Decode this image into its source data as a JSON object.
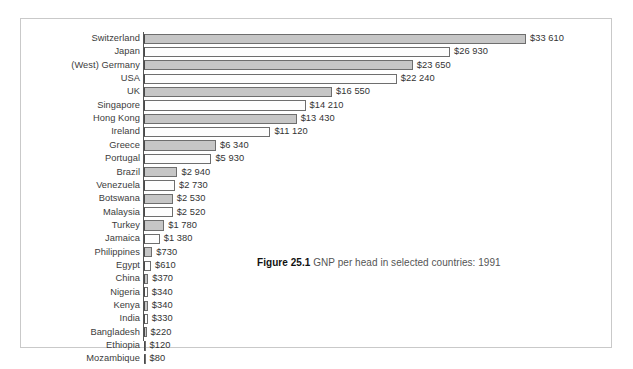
{
  "figure": {
    "number_label": "Figure 25.1",
    "caption_text": "GNP per head in selected countries: 1991"
  },
  "style": {
    "bar_fill_gray": "#c6c6c6",
    "bar_fill_white": "#fdfdfd",
    "bar_border": "#6e6e6e",
    "frame_border": "#c9c9c9",
    "label_color": "#3c3c3c"
  },
  "chart_data": {
    "type": "bar",
    "orientation": "horizontal",
    "title": "GNP per head in selected countries: 1991",
    "xlabel": "",
    "ylabel": "",
    "xlim": [
      0,
      33610
    ],
    "grid": false,
    "legend": false,
    "value_prefix": "$",
    "thousands_separator": " ",
    "categories": [
      "Switzerland",
      "Japan",
      "(West) Germany",
      "USA",
      "UK",
      "Singapore",
      "Hong Kong",
      "Ireland",
      "Greece",
      "Portugal",
      "Brazil",
      "Venezuela",
      "Botswana",
      "Malaysia",
      "Turkey",
      "Jamaica",
      "Philippines",
      "Egypt",
      "China",
      "Nigeria",
      "Kenya",
      "India",
      "Bangladesh",
      "Ethiopia",
      "Mozambique"
    ],
    "values": [
      33610,
      26930,
      23650,
      22240,
      16550,
      14210,
      13430,
      11120,
      6340,
      5930,
      2940,
      2730,
      2530,
      2520,
      1780,
      1380,
      730,
      610,
      370,
      340,
      340,
      330,
      220,
      120,
      80
    ],
    "value_labels": [
      "$33 610",
      "$26 930",
      "$23 650",
      "$22 240",
      "$16 550",
      "$14 210",
      "$13 430",
      "$11 120",
      "$6 340",
      "$5 930",
      "$2 940",
      "$2 730",
      "$2 530",
      "$2 520",
      "$1 780",
      "$1 380",
      "$730",
      "$610",
      "$370",
      "$340",
      "$340",
      "$330",
      "$220",
      "$120",
      "$80"
    ]
  }
}
